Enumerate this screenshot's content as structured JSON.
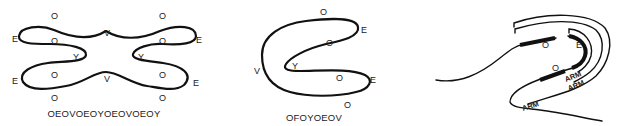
{
  "figure_1": {
    "caption": "OEOVOEOYOEOVOEOY",
    "labels": {
      "top_left_o": "O",
      "top_right_o": "O",
      "left_upper_e": "E",
      "right_upper_e": "E",
      "inner_upper_left_o": "O",
      "inner_upper_right_o": "O",
      "top_v": "V",
      "left_y": "Y",
      "right_y": "Y",
      "inner_lower_left_o": "O",
      "inner_lower_right_o": "O",
      "bottom_v": "V",
      "left_lower_e": "E",
      "right_lower_e": "E",
      "bottom_left_o": "O",
      "bottom_right_o": "O"
    }
  },
  "figure_2": {
    "caption": "OFOYOEOV",
    "labels": {
      "top_o": "O",
      "upper_e": "E",
      "inner_upper_o": "O",
      "v": "V",
      "y": "Y",
      "inner_lower_o": "O",
      "lower_e": "E",
      "bottom_o": "O"
    }
  },
  "figure_3": {
    "labels": {
      "o_upper": "O",
      "e": "E",
      "o_lower": "O",
      "arm_1": "ARM",
      "arm_2": "ARM",
      "arm_3": "ARM"
    }
  }
}
